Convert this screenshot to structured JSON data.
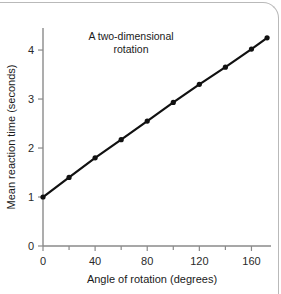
{
  "chart_data": {
    "type": "line",
    "title": "A two-dimensional rotation",
    "title_lines": [
      "A two-dimensional",
      "rotation"
    ],
    "xlabel": "Angle of rotation (degrees)",
    "ylabel": "Mean reaction time (seconds)",
    "xlim": [
      0,
      175
    ],
    "ylim": [
      0,
      4.45
    ],
    "xticks": [
      0,
      40,
      80,
      120,
      160
    ],
    "xticklabels": [
      "0",
      "40",
      "80",
      "120",
      "160"
    ],
    "xminorticks": [
      20,
      60,
      100,
      140
    ],
    "yticks": [
      0,
      1,
      2,
      3,
      4
    ],
    "yticklabels": [
      "0",
      "1",
      "2",
      "3",
      "4"
    ],
    "grid": false,
    "legend": false,
    "marker": "filled-circle",
    "line_color": "#111111",
    "axis_color": "#8a8a8a",
    "x": [
      0,
      20,
      40,
      60,
      80,
      100,
      120,
      140,
      160,
      172
    ],
    "y": [
      1.0,
      1.4,
      1.8,
      2.17,
      2.55,
      2.93,
      3.3,
      3.65,
      4.02,
      4.25
    ],
    "points": [
      {
        "x": 0,
        "y": 1.0
      },
      {
        "x": 20,
        "y": 1.4
      },
      {
        "x": 40,
        "y": 1.8
      },
      {
        "x": 60,
        "y": 2.17
      },
      {
        "x": 80,
        "y": 2.55
      },
      {
        "x": 100,
        "y": 2.93
      },
      {
        "x": 120,
        "y": 3.3
      },
      {
        "x": 140,
        "y": 3.65
      },
      {
        "x": 160,
        "y": 4.02
      },
      {
        "x": 172,
        "y": 4.25
      }
    ],
    "series": [
      {
        "name": "A two-dimensional rotation",
        "values": [
          1.0,
          1.4,
          1.8,
          2.17,
          2.55,
          2.93,
          3.3,
          3.65,
          4.02,
          4.25
        ]
      }
    ]
  }
}
